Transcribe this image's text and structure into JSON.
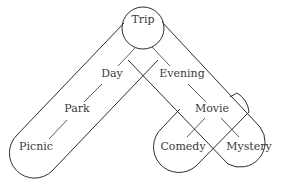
{
  "diagram": {
    "type": "tree-with-grouping-capsules",
    "root": "Trip",
    "nodes": [
      {
        "id": "trip",
        "label": "Trip",
        "x": 143,
        "y": 23
      },
      {
        "id": "day",
        "label": "Day",
        "x": 112,
        "y": 77
      },
      {
        "id": "evening",
        "label": "Evening",
        "x": 182,
        "y": 77
      },
      {
        "id": "park",
        "label": "Park",
        "x": 77,
        "y": 112
      },
      {
        "id": "movie",
        "label": "Movie",
        "x": 212,
        "y": 112
      },
      {
        "id": "picnic",
        "label": "Picnic",
        "x": 36,
        "y": 150
      },
      {
        "id": "comedy",
        "label": "Comedy",
        "x": 183,
        "y": 150
      },
      {
        "id": "mystery",
        "label": "Mystery",
        "x": 249,
        "y": 150
      }
    ],
    "edges": [
      {
        "from": "Trip",
        "to": "Day"
      },
      {
        "from": "Trip",
        "to": "Evening"
      },
      {
        "from": "Day",
        "to": "Park"
      },
      {
        "from": "Evening",
        "to": "Movie"
      },
      {
        "from": "Park",
        "to": "Picnic"
      },
      {
        "from": "Movie",
        "to": "Comedy"
      },
      {
        "from": "Movie",
        "to": "Mystery"
      }
    ],
    "groups": [
      {
        "name": "trip-day-park-picnic",
        "members": [
          "Trip",
          "Day",
          "Park",
          "Picnic"
        ]
      },
      {
        "name": "trip-evening-movie-mystery",
        "members": [
          "Trip",
          "Evening",
          "Movie",
          "Mystery"
        ]
      },
      {
        "name": "movie-comedy",
        "members": [
          "Movie",
          "Comedy"
        ]
      }
    ],
    "colors": {
      "stroke": "#2e2e2e",
      "text": "#3a3a3a",
      "background": "#ffffff"
    }
  }
}
